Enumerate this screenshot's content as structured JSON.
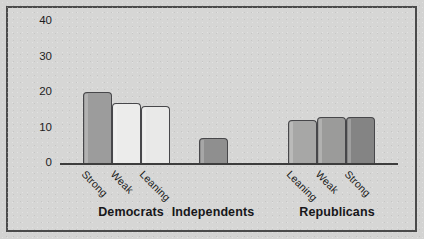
{
  "figure": {
    "background_color": "#d3d3d2",
    "plot_background_color": "#d6d6d5",
    "frame_color": "#4a4a4a",
    "axis_color": "#3d3d3d"
  },
  "chart_data": {
    "type": "bar",
    "title": "",
    "subtitle": "",
    "xlabel": "",
    "ylabel": "",
    "ylim": [
      0,
      44
    ],
    "grid": false,
    "legend": "none",
    "ytick_labels": [
      "40",
      "30",
      "20",
      "10",
      "0"
    ],
    "ytick_values": [
      40,
      30,
      20,
      10,
      0
    ],
    "groups": [
      {
        "name": "Democrats",
        "label": "Democrats",
        "bars": [
          {
            "category": "Strong",
            "value": 20,
            "color": "#9c9c9c"
          },
          {
            "category": "Weak",
            "value": 17,
            "color": "#ececeb"
          },
          {
            "category": "Leaning",
            "value": 16,
            "color": "#e9e9e8"
          }
        ]
      },
      {
        "name": "Independents",
        "label": "Independents",
        "bars": [
          {
            "category": "",
            "value": 7,
            "color": "#8f8f8f"
          }
        ]
      },
      {
        "name": "Republicans",
        "label": "Republicans",
        "bars": [
          {
            "category": "Leaning",
            "value": 12,
            "color": "#a7a7a6"
          },
          {
            "category": "Weak",
            "value": 13,
            "color": "#9b9b9a"
          },
          {
            "category": "Strong",
            "value": 13,
            "color": "#848484"
          }
        ]
      }
    ],
    "categories": [
      "Strong",
      "Weak",
      "Leaning",
      "",
      "Leaning",
      "Weak",
      "Strong"
    ],
    "values": [
      20,
      17,
      16,
      7,
      12,
      13,
      13
    ]
  }
}
